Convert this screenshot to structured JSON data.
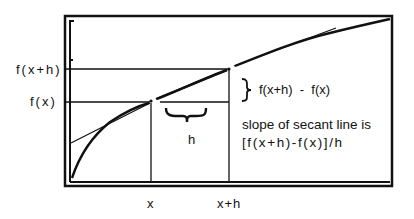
{
  "diagram": {
    "type": "secant-line-illustration",
    "y_labels": {
      "fxh": "f(x+h)",
      "fx": "f(x)"
    },
    "x_labels": {
      "x": "x",
      "xh": "x+h"
    },
    "h_label": "h",
    "difference_label": "f(x+h)  -  f(x)",
    "slope_text": {
      "line1": "slope of secant line is",
      "line2": "[f(x+h)-f(x)]/h"
    },
    "colors": {
      "ink": "#111111",
      "background": "#ffffff"
    }
  }
}
